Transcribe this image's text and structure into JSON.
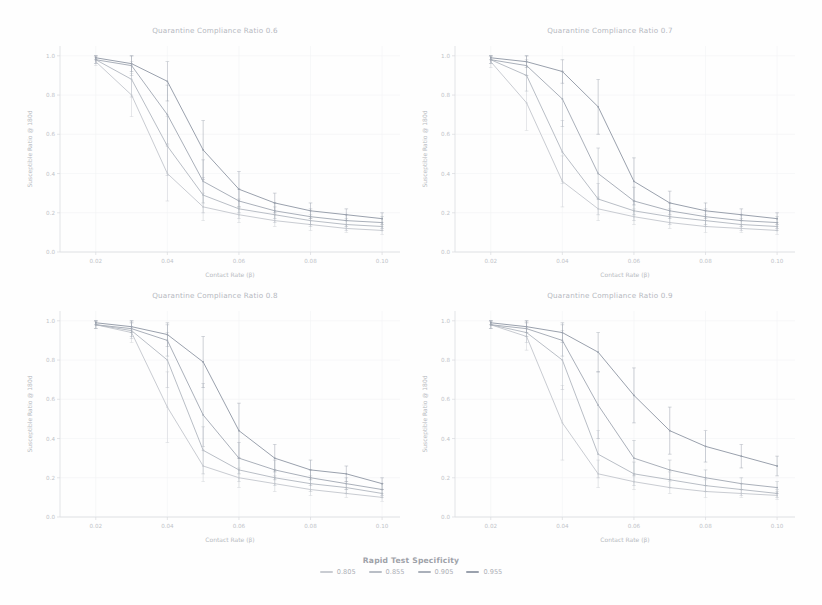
{
  "figure": {
    "panel_titles": [
      "Quarantine Compliance Ratio 0.6",
      "Quarantine Compliance Ratio 0.7",
      "Quarantine Compliance Ratio 0.8",
      "Quarantine Compliance Ratio 0.9"
    ],
    "xlabel": "Contact Rate (β)",
    "ylabel": "Susceptible Ratio @ 180d"
  },
  "legend": {
    "title": "Rapid Test Specificity",
    "entries": [
      {
        "label": "0.805",
        "color": "#c9ccd2"
      },
      {
        "label": "0.855",
        "color": "#b9bec6"
      },
      {
        "label": "0.905",
        "color": "#aab0ba"
      },
      {
        "label": "0.955",
        "color": "#9aa1ad"
      }
    ]
  },
  "chart_data": {
    "type": "line",
    "xlabel": "Contact Rate (β)",
    "ylabel": "Susceptible Ratio @ 180d",
    "xlim": [
      0.01,
      0.105
    ],
    "ylim": [
      0.0,
      1.05
    ],
    "xticks": [
      0.02,
      0.04,
      0.06,
      0.08,
      0.1
    ],
    "xticklabels": [
      "0.02",
      "0.04",
      "0.06",
      "0.08",
      "0.10"
    ],
    "yticks": [
      0.0,
      0.2,
      0.4,
      0.6,
      0.8,
      1.0
    ],
    "yticklabels": [
      "0.0",
      "0.2",
      "0.4",
      "0.6",
      "0.8",
      "1.0"
    ],
    "grid": true,
    "legend_position": "bottom",
    "legend_title": "Rapid Test Specificity",
    "error_bars": true,
    "x": [
      0.02,
      0.03,
      0.04,
      0.05,
      0.06,
      0.07,
      0.08,
      0.09,
      0.1
    ],
    "panels": [
      {
        "facet": "Quarantine Compliance Ratio 0.6",
        "series": [
          {
            "name": "0.805",
            "color": "#c9ccd2",
            "values": [
              0.97,
              0.8,
              0.4,
              0.23,
              0.19,
              0.16,
              0.14,
              0.12,
              0.11
            ],
            "errors": [
              0.02,
              0.11,
              0.14,
              0.07,
              0.04,
              0.03,
              0.03,
              0.02,
              0.02
            ]
          },
          {
            "name": "0.855",
            "color": "#b9bec6",
            "values": [
              0.98,
              0.88,
              0.54,
              0.29,
              0.22,
              0.19,
              0.16,
              0.14,
              0.13
            ],
            "errors": [
              0.02,
              0.09,
              0.15,
              0.09,
              0.05,
              0.04,
              0.03,
              0.03,
              0.02
            ]
          },
          {
            "name": "0.905",
            "color": "#aab0ba",
            "values": [
              0.98,
              0.95,
              0.7,
              0.36,
              0.26,
              0.21,
              0.18,
              0.16,
              0.15
            ],
            "errors": [
              0.02,
              0.05,
              0.15,
              0.11,
              0.06,
              0.04,
              0.04,
              0.03,
              0.03
            ]
          },
          {
            "name": "0.955",
            "color": "#9aa1ad",
            "values": [
              0.99,
              0.96,
              0.87,
              0.52,
              0.32,
              0.25,
              0.21,
              0.19,
              0.17
            ],
            "errors": [
              0.01,
              0.04,
              0.1,
              0.15,
              0.09,
              0.05,
              0.04,
              0.03,
              0.03
            ]
          }
        ]
      },
      {
        "facet": "Quarantine Compliance Ratio 0.7",
        "series": [
          {
            "name": "0.805",
            "color": "#c9ccd2",
            "values": [
              0.97,
              0.76,
              0.36,
              0.22,
              0.18,
              0.15,
              0.13,
              0.12,
              0.11
            ],
            "errors": [
              0.03,
              0.14,
              0.13,
              0.06,
              0.04,
              0.03,
              0.03,
              0.02,
              0.02
            ]
          },
          {
            "name": "0.855",
            "color": "#b9bec6",
            "values": [
              0.98,
              0.9,
              0.51,
              0.27,
              0.21,
              0.18,
              0.16,
              0.14,
              0.13
            ],
            "errors": [
              0.02,
              0.08,
              0.16,
              0.08,
              0.05,
              0.04,
              0.03,
              0.03,
              0.02
            ]
          },
          {
            "name": "0.905",
            "color": "#aab0ba",
            "values": [
              0.98,
              0.95,
              0.78,
              0.4,
              0.26,
              0.21,
              0.18,
              0.16,
              0.15
            ],
            "errors": [
              0.02,
              0.05,
              0.14,
              0.13,
              0.07,
              0.04,
              0.04,
              0.03,
              0.03
            ]
          },
          {
            "name": "0.955",
            "color": "#9aa1ad",
            "values": [
              0.99,
              0.97,
              0.92,
              0.74,
              0.36,
              0.25,
              0.21,
              0.19,
              0.17
            ],
            "errors": [
              0.01,
              0.03,
              0.06,
              0.14,
              0.12,
              0.06,
              0.04,
              0.03,
              0.03
            ]
          }
        ]
      },
      {
        "facet": "Quarantine Compliance Ratio 0.8",
        "series": [
          {
            "name": "0.805",
            "color": "#c9ccd2",
            "values": [
              0.98,
              0.94,
              0.56,
              0.26,
              0.2,
              0.17,
              0.14,
              0.12,
              0.1
            ],
            "errors": [
              0.02,
              0.05,
              0.18,
              0.08,
              0.05,
              0.04,
              0.03,
              0.02,
              0.02
            ]
          },
          {
            "name": "0.855",
            "color": "#b9bec6",
            "values": [
              0.98,
              0.95,
              0.8,
              0.34,
              0.24,
              0.2,
              0.17,
              0.15,
              0.12
            ],
            "errors": [
              0.02,
              0.04,
              0.14,
              0.12,
              0.06,
              0.04,
              0.04,
              0.03,
              0.02
            ]
          },
          {
            "name": "0.905",
            "color": "#aab0ba",
            "values": [
              0.98,
              0.96,
              0.9,
              0.52,
              0.3,
              0.24,
              0.2,
              0.17,
              0.14
            ],
            "errors": [
              0.02,
              0.04,
              0.08,
              0.16,
              0.08,
              0.05,
              0.04,
              0.03,
              0.03
            ]
          },
          {
            "name": "0.955",
            "color": "#9aa1ad",
            "values": [
              0.99,
              0.97,
              0.93,
              0.79,
              0.44,
              0.3,
              0.24,
              0.22,
              0.17
            ],
            "errors": [
              0.01,
              0.03,
              0.06,
              0.13,
              0.14,
              0.07,
              0.05,
              0.04,
              0.03
            ]
          }
        ]
      },
      {
        "facet": "Quarantine Compliance Ratio 0.9",
        "series": [
          {
            "name": "0.805",
            "color": "#c9ccd2",
            "values": [
              0.98,
              0.92,
              0.48,
              0.22,
              0.18,
              0.15,
              0.13,
              0.12,
              0.11
            ],
            "errors": [
              0.02,
              0.07,
              0.19,
              0.07,
              0.04,
              0.03,
              0.03,
              0.02,
              0.02
            ]
          },
          {
            "name": "0.855",
            "color": "#b9bec6",
            "values": [
              0.98,
              0.94,
              0.8,
              0.32,
              0.22,
              0.19,
              0.16,
              0.14,
              0.12
            ],
            "errors": [
              0.02,
              0.05,
              0.15,
              0.12,
              0.06,
              0.04,
              0.03,
              0.03,
              0.02
            ]
          },
          {
            "name": "0.905",
            "color": "#aab0ba",
            "values": [
              0.98,
              0.96,
              0.9,
              0.57,
              0.3,
              0.24,
              0.2,
              0.17,
              0.15
            ],
            "errors": [
              0.02,
              0.04,
              0.08,
              0.17,
              0.09,
              0.05,
              0.04,
              0.03,
              0.03
            ]
          },
          {
            "name": "0.955",
            "color": "#9aa1ad",
            "values": [
              0.99,
              0.97,
              0.94,
              0.84,
              0.62,
              0.44,
              0.36,
              0.31,
              0.26
            ],
            "errors": [
              0.01,
              0.03,
              0.05,
              0.1,
              0.14,
              0.12,
              0.08,
              0.06,
              0.05
            ]
          }
        ]
      }
    ]
  }
}
